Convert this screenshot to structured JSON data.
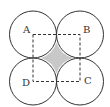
{
  "diagram": {
    "labels": {
      "A": "A",
      "B": "B",
      "C": "C",
      "D": "D"
    },
    "colors": {
      "stroke": "#333333",
      "shade": "#c8c8c8",
      "background": "#ffffff"
    }
  }
}
